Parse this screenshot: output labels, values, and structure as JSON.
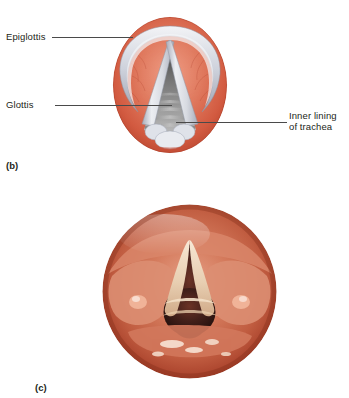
{
  "figure": {
    "background_color": "#ffffff",
    "text_color": "#231f20",
    "leader_color": "#4a4a4a"
  },
  "panel_b": {
    "caption": "(b)",
    "view_description": "Superior view of the larynx showing the epiglottis, vocal folds and the glottis opening into the trachea",
    "labels": [
      {
        "id": "epiglottis",
        "line1": "Epiglottis",
        "line2": ""
      },
      {
        "id": "glottis",
        "line1": "Glottis",
        "line2": ""
      },
      {
        "id": "inner-lining",
        "line1": "Inner lining",
        "line2": "of trachea"
      }
    ],
    "colors": {
      "mucosa_light": "#e8927a",
      "mucosa_mid": "#d7604a",
      "mucosa_dark": "#b8462f",
      "fold_light": "#eceef2",
      "fold_mid": "#c9ccd6",
      "fold_shadow": "#a2a6b4",
      "airway_light": "#8d8d8d",
      "airway_dark": "#2e2e2e",
      "vessel": "#b0412c"
    }
  },
  "panel_c": {
    "caption": "(c)",
    "view_description": "Laryngoscopic photograph of the human larynx showing the true vocal folds and the dark glottic airway",
    "colors": {
      "mucosa_light": "#e8a38c",
      "mucosa_mid": "#cf6d52",
      "mucosa_deep": "#a8351f",
      "fold_pale": "#f0ddc8",
      "fold_cream": "#e3c6a6",
      "airway_dark": "#3d1b14",
      "airway_black": "#21100c",
      "highlight": "#fbece0"
    }
  }
}
